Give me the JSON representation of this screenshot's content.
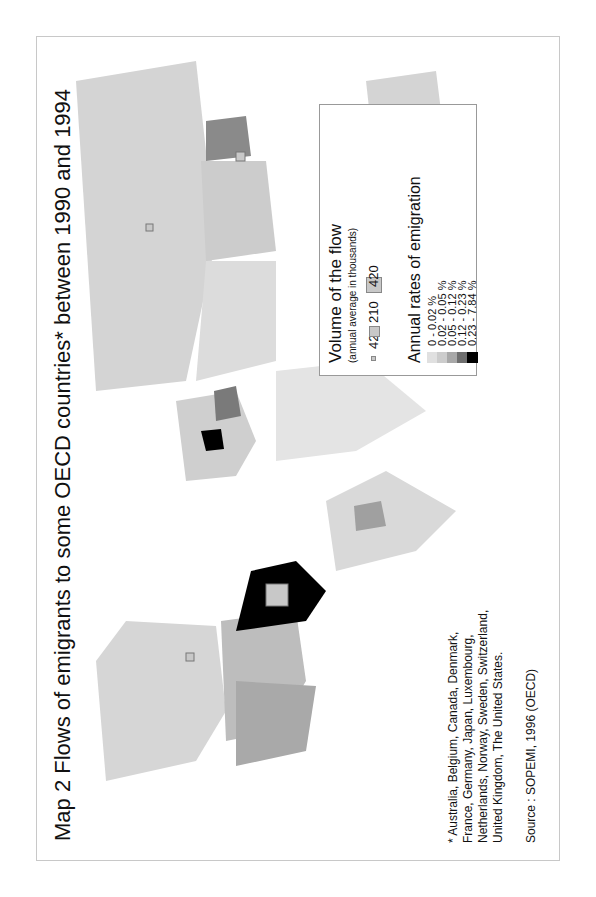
{
  "title": "Map 2 Flows of emigrants to some OECD countries* between 1990 and 1994",
  "legend": {
    "volume_title": "Volume of the flow",
    "volume_subtitle": "(annual average in thousands)",
    "volume_items": [
      {
        "label": "42",
        "size": "small"
      },
      {
        "label": "210",
        "size": "medium"
      },
      {
        "label": "420",
        "size": "large"
      }
    ],
    "rates_title": "Annual rates of emigration",
    "rate_items": [
      {
        "label": "0    - 0.02 %",
        "color": "#e0e0e0"
      },
      {
        "label": "0.02 - 0.05 %",
        "color": "#cccccc"
      },
      {
        "label": "0.05 - 0.12 %",
        "color": "#a8a8a8"
      },
      {
        "label": "0.12 - 0.23 %",
        "color": "#6e6e6e"
      },
      {
        "label": "0.23 - 7.84 %",
        "color": "#000000"
      }
    ]
  },
  "footnote": "* Australia, Belgium, Canada, Denmark, France, Germany, Japan, Luxembourg, Netherlands, Norway, Sweden, Switzerland, United Kingdom, The United States.",
  "source": "Source : SOPEMI, 1996 (OECD)"
}
